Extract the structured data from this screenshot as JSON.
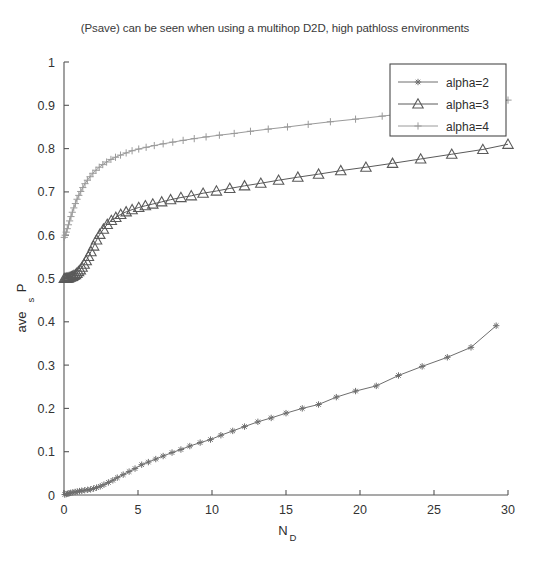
{
  "chart_data": {
    "type": "line",
    "title": "(Psave) can be seen when using a multihop D2D, high pathloss environments",
    "xlabel": "N_D",
    "xlabel_main": "N",
    "xlabel_sub": "D",
    "ylabel": "P_s ave",
    "ylabel_main": "P",
    "ylabel_sub": "s",
    "ylabel_tail": "ave",
    "xlim": [
      0,
      30
    ],
    "ylim": [
      0,
      1
    ],
    "xticks": [
      0,
      5,
      10,
      15,
      20,
      25,
      30
    ],
    "xtick_labels": [
      "0",
      "5",
      "10",
      "15",
      "20",
      "25",
      "30"
    ],
    "yticks": [
      0,
      0.1,
      0.2,
      0.3,
      0.4,
      0.5,
      0.6,
      0.7,
      0.8,
      0.9,
      1
    ],
    "ytick_labels": [
      "0",
      "0.1",
      "0.2",
      "0.3",
      "0.4",
      "0.5",
      "0.6",
      "0.7",
      "0.8",
      "0.9",
      "1"
    ],
    "grid": false,
    "legend_position": "upper right",
    "series": [
      {
        "name": "alpha=2",
        "marker": "star",
        "color": "#6e6e6e",
        "x": [
          0.05,
          0.15,
          0.25,
          0.35,
          0.45,
          0.6,
          0.75,
          0.9,
          1.05,
          1.2,
          1.4,
          1.6,
          1.8,
          2.0,
          2.2,
          2.45,
          2.7,
          3.0,
          3.3,
          3.6,
          4.0,
          4.4,
          4.8,
          5.25,
          5.7,
          6.2,
          6.7,
          7.3,
          7.9,
          8.5,
          9.2,
          9.9,
          10.6,
          11.4,
          12.2,
          13.1,
          14.0,
          15.0,
          16.1,
          17.2,
          18.4,
          19.7,
          21.1,
          22.6,
          24.2,
          25.9,
          27.5,
          29.2
        ],
        "y": [
          0.001,
          0.002,
          0.003,
          0.004,
          0.005,
          0.006,
          0.007,
          0.008,
          0.009,
          0.01,
          0.011,
          0.012,
          0.013,
          0.015,
          0.017,
          0.02,
          0.024,
          0.029,
          0.034,
          0.04,
          0.047,
          0.054,
          0.061,
          0.07,
          0.076,
          0.083,
          0.09,
          0.098,
          0.105,
          0.113,
          0.121,
          0.128,
          0.138,
          0.148,
          0.158,
          0.169,
          0.178,
          0.189,
          0.2,
          0.209,
          0.226,
          0.24,
          0.252,
          0.276,
          0.297,
          0.318,
          0.341,
          0.391
        ]
      },
      {
        "name": "alpha=3",
        "marker": "triangle",
        "color": "#5a5a5a",
        "x": [
          0.02,
          0.08,
          0.14,
          0.2,
          0.27,
          0.34,
          0.42,
          0.5,
          0.58,
          0.67,
          0.77,
          0.87,
          0.98,
          1.1,
          1.22,
          1.36,
          1.5,
          1.65,
          1.82,
          2.0,
          2.2,
          2.42,
          2.66,
          2.92,
          3.2,
          3.5,
          3.83,
          4.2,
          4.6,
          5.05,
          5.5,
          6.0,
          6.6,
          7.2,
          7.9,
          8.6,
          9.4,
          10.3,
          11.2,
          12.2,
          13.3,
          14.5,
          15.8,
          17.2,
          18.7,
          20.4,
          22.2,
          24.1,
          26.2,
          28.3,
          30.0
        ],
        "y": [
          0.5,
          0.5,
          0.5,
          0.501,
          0.501,
          0.502,
          0.503,
          0.504,
          0.505,
          0.507,
          0.509,
          0.512,
          0.516,
          0.52,
          0.526,
          0.533,
          0.541,
          0.551,
          0.562,
          0.575,
          0.589,
          0.602,
          0.614,
          0.625,
          0.634,
          0.641,
          0.648,
          0.654,
          0.659,
          0.664,
          0.668,
          0.672,
          0.677,
          0.682,
          0.687,
          0.691,
          0.697,
          0.702,
          0.708,
          0.714,
          0.72,
          0.727,
          0.734,
          0.741,
          0.749,
          0.757,
          0.766,
          0.776,
          0.787,
          0.798,
          0.81
        ]
      },
      {
        "name": "alpha=4",
        "marker": "plus",
        "color": "#9a9a9a",
        "x": [
          0.02,
          0.08,
          0.15,
          0.22,
          0.3,
          0.38,
          0.47,
          0.56,
          0.66,
          0.77,
          0.88,
          1.0,
          1.13,
          1.27,
          1.42,
          1.58,
          1.76,
          1.95,
          2.16,
          2.38,
          2.62,
          2.88,
          3.17,
          3.48,
          3.82,
          4.2,
          4.6,
          5.05,
          5.55,
          6.1,
          6.7,
          7.35,
          8.05,
          8.8,
          9.6,
          10.5,
          11.5,
          12.6,
          13.8,
          15.1,
          16.5,
          18.0,
          19.7,
          21.5,
          23.5,
          25.6,
          27.8,
          30.0
        ],
        "y": [
          0.595,
          0.6,
          0.607,
          0.615,
          0.624,
          0.633,
          0.643,
          0.653,
          0.663,
          0.673,
          0.683,
          0.692,
          0.701,
          0.71,
          0.719,
          0.727,
          0.735,
          0.743,
          0.75,
          0.757,
          0.763,
          0.769,
          0.775,
          0.78,
          0.785,
          0.79,
          0.795,
          0.799,
          0.803,
          0.807,
          0.811,
          0.815,
          0.819,
          0.823,
          0.827,
          0.831,
          0.835,
          0.84,
          0.845,
          0.85,
          0.856,
          0.862,
          0.868,
          0.875,
          0.883,
          0.891,
          0.9,
          0.912
        ]
      }
    ]
  },
  "legend": {
    "items": [
      {
        "label": "alpha=2"
      },
      {
        "label": "alpha=3"
      },
      {
        "label": "alpha=4"
      }
    ]
  }
}
